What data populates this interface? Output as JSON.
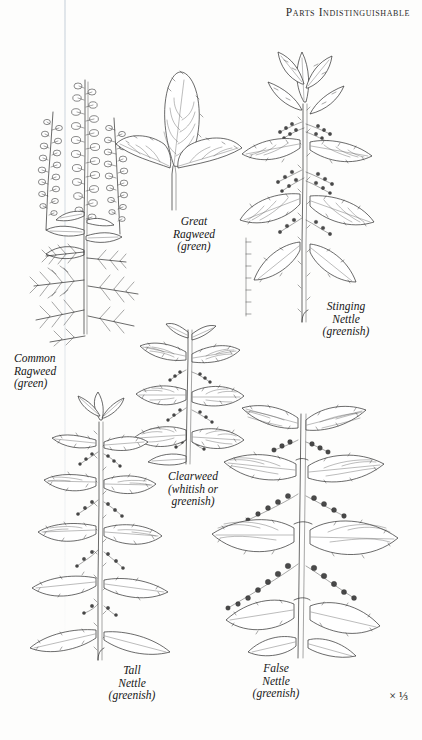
{
  "page": {
    "running_head": "Parts Indistinguishable",
    "scale_note": "× ⅓",
    "background_color": "#fdfdfc",
    "ink_color": "#2b2b2b"
  },
  "plates": [
    {
      "id": "common-ragweed",
      "name": "Common Ragweed",
      "caption": "Common\nRagweed\n(green)",
      "color_note": "green"
    },
    {
      "id": "great-ragweed",
      "name": "Great Ragweed",
      "caption": "Great\nRagweed\n(green)",
      "color_note": "green"
    },
    {
      "id": "stinging-nettle",
      "name": "Stinging Nettle",
      "caption": "Stinging\nNettle\n(greenish)",
      "color_note": "greenish"
    },
    {
      "id": "clearweed",
      "name": "Clearweed",
      "caption": "Clearweed\n(whitish or\ngreenish)",
      "color_note": "whitish or greenish"
    },
    {
      "id": "tall-nettle",
      "name": "Tall Nettle",
      "caption": "Tall\nNettle\n(greenish)",
      "color_note": "greenish"
    },
    {
      "id": "false-nettle",
      "name": "False Nettle",
      "caption": "False\nNettle\n(greenish)",
      "color_note": "greenish"
    }
  ]
}
